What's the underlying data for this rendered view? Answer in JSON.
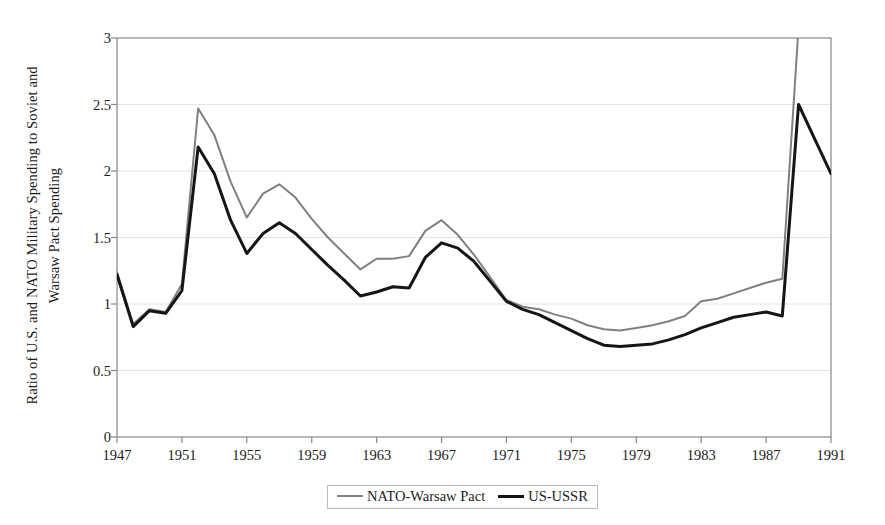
{
  "chart_data": {
    "type": "line",
    "title": "",
    "xlabel": "",
    "ylabel": "Ratio of U.S. and NATO Military Spending to Soviet and Warsaw Pact Spending",
    "ylabel_lines": [
      "Ratio of U.S. and NATO Military Spending to Soviet and",
      "Warsaw Pact Spending"
    ],
    "xlim": [
      1947,
      1991
    ],
    "ylim": [
      0,
      3
    ],
    "grid": "horizontal",
    "legend_position": "bottom-center",
    "y_ticks": [
      "0",
      "0.5",
      "1",
      "1.5",
      "2",
      "2.5",
      "3"
    ],
    "y_tick_values": [
      0,
      0.5,
      1,
      1.5,
      2,
      2.5,
      3
    ],
    "x_ticks": [
      "1947",
      "1951",
      "1955",
      "1959",
      "1963",
      "1967",
      "1971",
      "1975",
      "1979",
      "1983",
      "1987",
      "1991"
    ],
    "x_tick_values": [
      1947,
      1951,
      1955,
      1959,
      1963,
      1967,
      1971,
      1975,
      1979,
      1983,
      1987,
      1991
    ],
    "x": [
      1947,
      1948,
      1949,
      1950,
      1951,
      1952,
      1953,
      1954,
      1955,
      1956,
      1957,
      1958,
      1959,
      1960,
      1961,
      1962,
      1963,
      1964,
      1965,
      1966,
      1967,
      1968,
      1969,
      1970,
      1971,
      1972,
      1973,
      1974,
      1975,
      1976,
      1977,
      1978,
      1979,
      1980,
      1981,
      1982,
      1983,
      1984,
      1985,
      1986,
      1987,
      1988,
      1989,
      1990,
      1991
    ],
    "series": [
      {
        "name": "NATO-Warsaw Pact",
        "color": "#808080",
        "width": 2,
        "values": [
          1.24,
          0.85,
          0.96,
          0.94,
          1.15,
          2.47,
          2.27,
          1.92,
          1.65,
          1.83,
          1.9,
          1.8,
          1.64,
          1.5,
          1.38,
          1.26,
          1.34,
          1.34,
          1.36,
          1.55,
          1.63,
          1.52,
          1.37,
          1.2,
          1.03,
          0.98,
          0.96,
          0.92,
          0.89,
          0.84,
          0.81,
          0.8,
          0.82,
          0.84,
          0.87,
          0.91,
          1.02,
          1.04,
          1.08,
          1.12,
          1.16,
          1.19,
          3.08,
          3.3,
          3.5
        ]
      },
      {
        "name": "US-USSR",
        "color": "#151515",
        "width": 3,
        "values": [
          1.22,
          0.83,
          0.95,
          0.93,
          1.1,
          2.18,
          1.98,
          1.63,
          1.38,
          1.53,
          1.61,
          1.53,
          1.41,
          1.29,
          1.18,
          1.06,
          1.09,
          1.13,
          1.12,
          1.35,
          1.46,
          1.42,
          1.32,
          1.17,
          1.02,
          0.96,
          0.92,
          0.86,
          0.8,
          0.74,
          0.69,
          0.68,
          0.69,
          0.7,
          0.73,
          0.77,
          0.82,
          0.86,
          0.9,
          0.92,
          0.94,
          0.91,
          2.5,
          2.24,
          1.98
        ]
      }
    ],
    "notes": {
      "clipped_series": "NATO-Warsaw Pact exceeds the y-axis maximum of 3 after 1989"
    }
  },
  "legend": {
    "entries": [
      {
        "label": "NATO-Warsaw Pact",
        "swatch": "gray-line-swatch"
      },
      {
        "label": "US-USSR",
        "swatch": "black-line-swatch"
      }
    ]
  },
  "colors": {
    "nato_line": "#808080",
    "us_line": "#151515",
    "axis": "#888888",
    "grid": "#e2e2e2",
    "text": "#1c1c1c",
    "background": "#ffffff"
  }
}
